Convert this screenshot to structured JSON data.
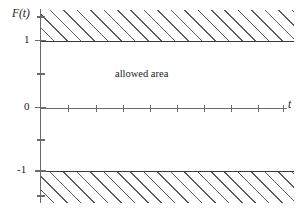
{
  "figure": {
    "axis_labels": {
      "y": "F(t)",
      "x": "t"
    },
    "annotation": "allowed area"
  },
  "chart_data": {
    "type": "area",
    "title": "",
    "xlabel": "t",
    "ylabel": "F(t)",
    "xlim": [
      0,
      10
    ],
    "ylim": [
      -1.5,
      1.5
    ],
    "grid": false,
    "legend": null,
    "y_tick_labels": [
      "1",
      "0",
      "-1"
    ],
    "y_tick_values": [
      1,
      0,
      -1
    ],
    "y_minor_tick_values": [
      1.5,
      0.5,
      -0.5,
      -1.5
    ],
    "x_tick_count": 9,
    "annotations": [
      {
        "text": "allowed area",
        "x": 4.3,
        "y": 0.45
      }
    ],
    "regions": [
      {
        "name": "forbidden-upper",
        "style": "hatched",
        "y_from": 1,
        "y_to": 1.5,
        "label": ""
      },
      {
        "name": "allowed",
        "style": "blank",
        "y_from": -1,
        "y_to": 1,
        "label": "allowed area"
      },
      {
        "name": "forbidden-lower",
        "style": "hatched",
        "y_from": -1.5,
        "y_to": -1,
        "label": ""
      }
    ],
    "boundary_lines": [
      {
        "name": "upper-bound",
        "y": 1
      },
      {
        "name": "lower-bound",
        "y": -1
      }
    ],
    "colors": {
      "hatch": "#5c5c5c",
      "axis": "#6a6a6a",
      "boundary": "#3a3a3a",
      "background": "#ffffff",
      "text": "#1a1a1a"
    }
  },
  "y_ticks": [
    {
      "pos": 17,
      "kind": "minor",
      "label": ""
    },
    {
      "pos": 40.5,
      "kind": "major",
      "label": "1"
    },
    {
      "pos": 74,
      "kind": "minor",
      "label": ""
    },
    {
      "pos": 107.5,
      "kind": "major",
      "label": "0"
    },
    {
      "pos": 140,
      "kind": "minor",
      "label": ""
    },
    {
      "pos": 171,
      "kind": "major",
      "label": "-1"
    },
    {
      "pos": 196,
      "kind": "minor",
      "label": ""
    }
  ],
  "x_ticks": [
    {
      "pos": 68
    },
    {
      "pos": 96
    },
    {
      "pos": 123
    },
    {
      "pos": 150
    },
    {
      "pos": 177
    },
    {
      "pos": 204
    },
    {
      "pos": 231
    },
    {
      "pos": 258
    },
    {
      "pos": 283
    }
  ]
}
